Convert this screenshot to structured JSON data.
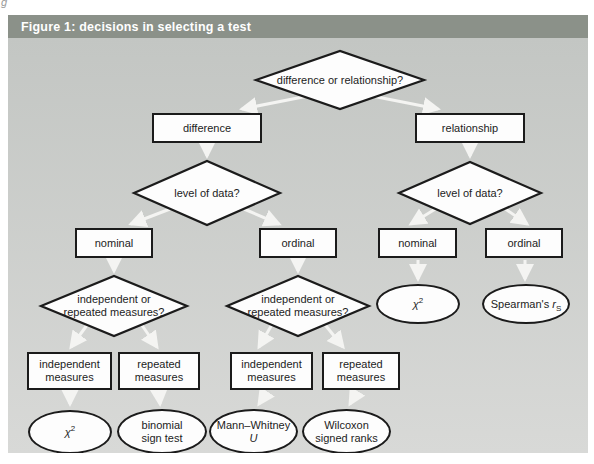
{
  "header": {
    "title": "Figure 1: decisions in selecting a test"
  },
  "colors": {
    "header_bg": "#8b9189",
    "panel_top": "#c3c6c3",
    "panel_bottom": "#d8d9d7",
    "node_fill": "#fdfdfd",
    "node_border": "#1b1b1b",
    "arrow": "#f4f4f2"
  },
  "nodes": {
    "root": "difference or relationship?",
    "difference": "difference",
    "relationship": "relationship",
    "level_left": "level of data?",
    "level_right": "level of data?",
    "nominal_left": "nominal",
    "ordinal_left": "ordinal",
    "nominal_right": "nominal",
    "ordinal_right": "ordinal",
    "measures_left": "independent or repeated measures?",
    "measures_right": "independent or repeated measures?",
    "chi_right": {
      "base": "χ",
      "sup": "2"
    },
    "spearman": {
      "prefix": "Spearman's ",
      "italic": "r",
      "sub": "S"
    },
    "independent_measures_1": "independent measures",
    "repeated_measures_1": "repeated measures",
    "independent_measures_2": "independent measures",
    "repeated_measures_2": "repeated measures",
    "chi_bottom": {
      "base": "χ",
      "sup": "2"
    },
    "binomial": "binomial sign test",
    "mann_whitney": {
      "line1": "Mann–Whitney",
      "line2": "U"
    },
    "wilcoxon": "Wilcoxon signed ranks"
  }
}
